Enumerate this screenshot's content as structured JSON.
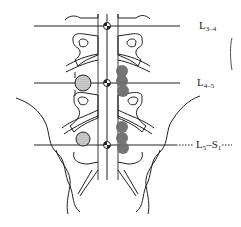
{
  "diagram": {
    "levels": [
      {
        "id": "l3-4",
        "main": "L",
        "sub": "3–4",
        "y": 26
      },
      {
        "id": "l4-5",
        "main": "L",
        "sub": "4–5",
        "y": 83
      },
      {
        "id": "l5-s1",
        "main": "L",
        "sub1": "5",
        "dash": "–S",
        "sub2": "1",
        "y": 145
      }
    ],
    "markers": {
      "midline_targets": [
        {
          "x": 107,
          "y": 26
        },
        {
          "x": 107,
          "y": 83
        },
        {
          "x": 107,
          "y": 145
        }
      ],
      "stippled_circles": [
        {
          "x": 83,
          "y": 83,
          "r": 8
        },
        {
          "x": 83,
          "y": 139,
          "r": 7
        }
      ],
      "dark_clusters": [
        {
          "x": 122,
          "y": 71,
          "r": 6
        },
        {
          "x": 122,
          "y": 81,
          "r": 6
        },
        {
          "x": 122,
          "y": 91,
          "r": 6
        },
        {
          "x": 122,
          "y": 127,
          "r": 6
        },
        {
          "x": 122,
          "y": 138,
          "r": 6
        },
        {
          "x": 122,
          "y": 148,
          "r": 6
        }
      ]
    },
    "colors": {
      "line": "#222222",
      "dark_fill": "#6e6e6e",
      "stipple": "#9a9a9a"
    }
  }
}
